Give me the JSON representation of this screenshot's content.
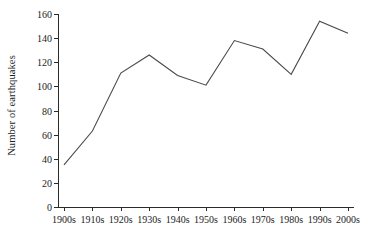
{
  "chart_data": {
    "type": "line",
    "title": "",
    "xlabel": "",
    "ylabel": "Number of earthquakes",
    "categories": [
      "1900s",
      "1910s",
      "1920s",
      "1930s",
      "1940s",
      "1950s",
      "1960s",
      "1970s",
      "1980s",
      "1990s",
      "2000s"
    ],
    "values": [
      35,
      63,
      111,
      126,
      109,
      101,
      138,
      131,
      110,
      154,
      144
    ],
    "series": [
      {
        "name": "Number of earthquakes",
        "values": [
          35,
          63,
          111,
          126,
          109,
          101,
          138,
          131,
          110,
          154,
          144
        ]
      }
    ],
    "ylim": [
      0,
      160
    ],
    "yticks": [
      0,
      20,
      40,
      60,
      80,
      100,
      120,
      140,
      160
    ],
    "ytick_labels": [
      "0",
      "20",
      "40",
      "60",
      "80",
      "100",
      "120",
      "140",
      "160"
    ],
    "grid": false,
    "legend": false,
    "legend_position": "none",
    "line_color": "#4a4a4a",
    "background_color": "#ffffff",
    "axis_color": "#2a2a2a",
    "markers": false
  }
}
